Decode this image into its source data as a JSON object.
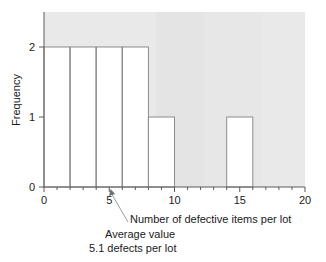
{
  "chart_data": {
    "type": "bar",
    "title": "",
    "subtitle": "",
    "xlabel": "Number of defective items per lot",
    "ylabel": "Frequency",
    "xlim": [
      0,
      20
    ],
    "ylim": [
      0,
      2.5
    ],
    "grid": false,
    "legend": null,
    "bin_width": 2,
    "categories": [
      "0-2",
      "2-4",
      "4-6",
      "6-8",
      "8-10",
      "10-12",
      "12-14",
      "14-16",
      "16-18",
      "18-20"
    ],
    "bin_edges": [
      0,
      2,
      4,
      6,
      8,
      10,
      12,
      14,
      16,
      18,
      20
    ],
    "values": [
      2,
      2,
      2,
      2,
      1,
      0,
      0,
      1,
      0,
      0
    ],
    "x_tick_labels": [
      "0",
      "5",
      "10",
      "15",
      "20"
    ],
    "x_tick_values": [
      0,
      5,
      10,
      15,
      20
    ],
    "x_minor_tick_values": [
      1,
      2,
      3,
      4,
      6,
      7,
      8,
      9,
      11,
      12,
      13,
      14,
      16,
      17,
      18,
      19
    ],
    "y_tick_labels": [
      "0",
      "1",
      "2"
    ],
    "y_tick_values": [
      0,
      1,
      2
    ],
    "annotations": [
      {
        "name": "average-value",
        "line1": "Average value",
        "line2": "5.1 defects per lot",
        "value": 5.1,
        "pointer_target_x": 5.1,
        "pointer_target_y": 0
      }
    ],
    "colors": {
      "plot_background": "#e8e8e8",
      "bar_fill": "#ffffff",
      "bar_edge": "#8c8c8c",
      "axis": "#5a5a5a",
      "text": "#1a1a1a",
      "leader_line": "#9a9a9a",
      "figure_background": "#ffffff"
    }
  }
}
